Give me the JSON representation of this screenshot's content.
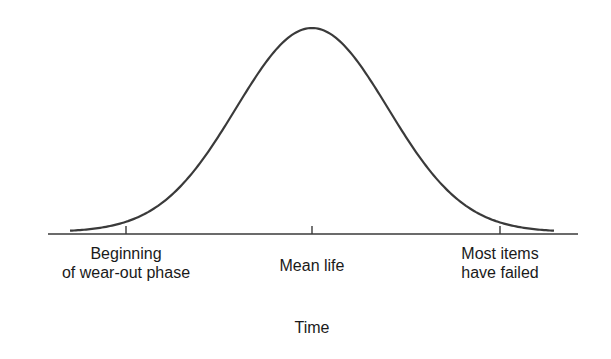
{
  "chart_data": {
    "type": "line",
    "title": "",
    "xlabel": "Time",
    "ylabel": "",
    "grid": false,
    "legend": null,
    "tick_labels": [
      {
        "position": "start",
        "lines": [
          "Beginning",
          "of wear-out phase"
        ]
      },
      {
        "position": "mean",
        "lines": [
          "Mean life"
        ]
      },
      {
        "position": "end",
        "lines": [
          "Most items",
          "have failed"
        ]
      }
    ],
    "series": [
      {
        "name": "failure density",
        "x": [
          -3.0,
          -2.5,
          -2.0,
          -1.5,
          -1.0,
          -0.5,
          0.0,
          0.5,
          1.0,
          1.5,
          2.0,
          2.5,
          3.0
        ],
        "y": [
          0.03,
          0.06,
          0.14,
          0.32,
          0.61,
          0.88,
          1.0,
          0.88,
          0.61,
          0.32,
          0.14,
          0.06,
          0.03
        ]
      }
    ],
    "xlim": [
      -3.5,
      3.5
    ],
    "ylim": [
      0,
      1.0
    ]
  },
  "labels": {
    "begin_line1": "Beginning",
    "begin_line2": "of wear-out phase",
    "mean": "Mean life",
    "end_line1": "Most items",
    "end_line2": "have failed",
    "xaxis": "Time"
  },
  "colors": {
    "curve": "#3a3a3a",
    "axis": "#3a3a3a",
    "text": "#1a1a1a"
  }
}
